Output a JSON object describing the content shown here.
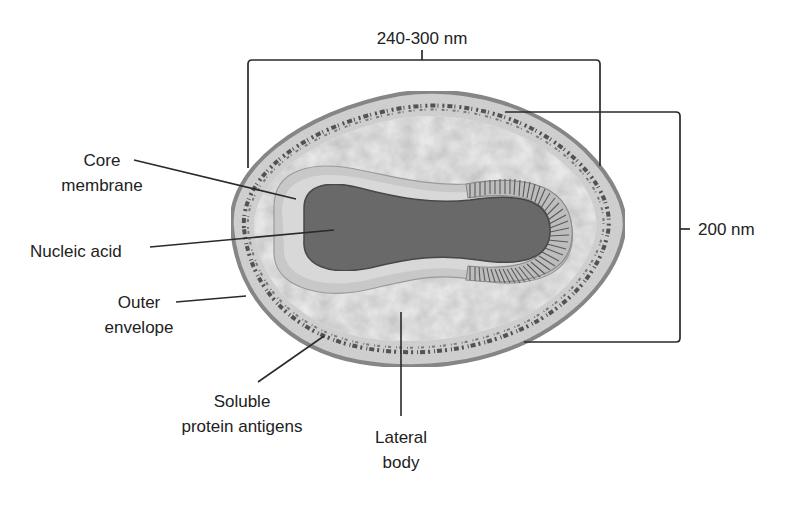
{
  "diagram": {
    "colors": {
      "background": "#ffffff",
      "outer_envelope": "#8c8c8c",
      "envelope_fill": "#d6d6d6",
      "protein_antigen_dots": "#3a3a3a",
      "lateral_body_fill": "#ececec",
      "core_membrane": "#c4c4c4",
      "nucleic_acid": "#6e6e6e",
      "text": "#222222",
      "lines": "#2a2a2a"
    },
    "dimensions": {
      "width_label": "240-300 nm",
      "height_label": "200 nm"
    },
    "labels": {
      "core_membrane": {
        "line1": "Core",
        "line2": "membrane"
      },
      "nucleic_acid": {
        "line1": "Nucleic acid"
      },
      "outer_envelope": {
        "line1": "Outer",
        "line2": "envelope"
      },
      "soluble_protein_antigens": {
        "line1": "Soluble",
        "line2": "protein antigens"
      },
      "lateral_body": {
        "line1": "Lateral",
        "line2": "body"
      }
    }
  }
}
